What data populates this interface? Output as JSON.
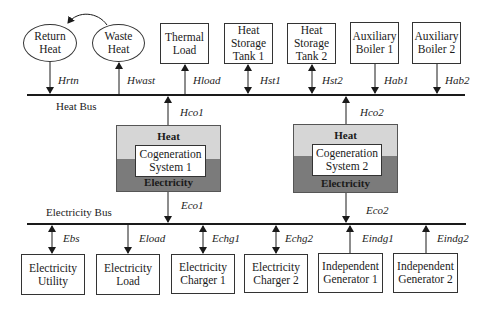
{
  "buses": {
    "heat": {
      "label": "Heat Bus"
    },
    "electricity": {
      "label": "Electricity Bus"
    }
  },
  "heat_nodes": [
    {
      "id": "return-heat",
      "label": "Return\nHeat",
      "shape": "ellipse",
      "flow": "Hrtn",
      "direction": "to-node"
    },
    {
      "id": "waste-heat",
      "label": "Waste\nHeat",
      "shape": "ellipse",
      "flow": "Hwast",
      "direction": "to-bus"
    },
    {
      "id": "thermal-load",
      "label": "Thermal\nLoad",
      "shape": "box",
      "flow": "Hload",
      "direction": "to-node"
    },
    {
      "id": "heat-storage-tank-1",
      "label": "Heat\nStorage\nTank 1",
      "shape": "box",
      "flow": "Hst1",
      "direction": "bidirectional"
    },
    {
      "id": "heat-storage-tank-2",
      "label": "Heat\nStorage\nTank 2",
      "shape": "box",
      "flow": "Hst2",
      "direction": "bidirectional"
    },
    {
      "id": "auxiliary-boiler-1",
      "label": "Auxiliary\nBoiler 1",
      "shape": "box",
      "flow": "Hab1",
      "direction": "to-bus"
    },
    {
      "id": "auxiliary-boiler-2",
      "label": "Auxiliary\nBoiler 2",
      "shape": "box",
      "flow": "Hab2",
      "direction": "to-bus"
    }
  ],
  "cogeneration": [
    {
      "id": "cogeneration-system-1",
      "label": "Cogeneration\nSystem 1",
      "heat_label": "Heat",
      "electricity_label": "Electricity",
      "heat_flow": "Hco1",
      "electricity_flow": "Eco1"
    },
    {
      "id": "cogeneration-system-2",
      "label": "Cogeneration\nSystem 2",
      "heat_label": "Heat",
      "electricity_label": "Electricity",
      "heat_flow": "Hco2",
      "electricity_flow": "Eco2"
    }
  ],
  "electricity_nodes": [
    {
      "id": "electricity-utility",
      "label": "Electricity\nUtility",
      "flow": "Ebs",
      "direction": "bidirectional"
    },
    {
      "id": "electricity-load",
      "label": "Electricity\nLoad",
      "flow": "Eload",
      "direction": "to-node"
    },
    {
      "id": "electricity-charger-1",
      "label": "Electricity\nCharger 1",
      "flow": "Echg1",
      "direction": "bidirectional"
    },
    {
      "id": "electricity-charger-2",
      "label": "Electricity\nCharger 2",
      "flow": "Echg2",
      "direction": "bidirectional"
    },
    {
      "id": "independent-generator-1",
      "label": "Independent\nGenerator 1",
      "flow": "Eindg1",
      "direction": "to-bus"
    },
    {
      "id": "independent-generator-2",
      "label": "Independent\nGenerator 2",
      "flow": "Eindg2",
      "direction": "to-bus"
    }
  ],
  "colors": {
    "line": "#1a1a1a",
    "cogen_heat_fill": "#d6d6d6",
    "cogen_electricity_fill": "#7b7b7b"
  }
}
